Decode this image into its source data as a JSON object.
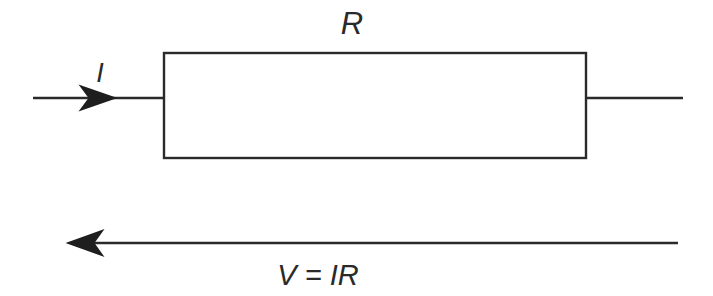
{
  "figure": {
    "kind": "circuit-diagram",
    "background_color": "#ffffff",
    "stroke_color": "#2a2a2a",
    "arrow_fill_color": "#1e1e1e",
    "width": 713,
    "height": 296
  },
  "labels": {
    "resistance": "R",
    "current": "I",
    "voltage_equation": "V = IR"
  },
  "components": {
    "resistor": {
      "name": "resistor-box",
      "label": "R",
      "x": 164,
      "y": 53,
      "width": 422,
      "height": 105
    },
    "input_wire": {
      "name": "input-wire",
      "label": "I",
      "from_x": 33,
      "to_x": 164,
      "y": 98,
      "direction": "right"
    },
    "output_wire": {
      "name": "output-wire",
      "from_x": 586,
      "to_x": 683,
      "y": 98,
      "direction": "right"
    },
    "voltage_arrow": {
      "name": "voltage-arrow",
      "label": "V = IR",
      "from_x": 678,
      "to_x": 66,
      "y": 243,
      "direction": "left"
    }
  },
  "annotations": {
    "resistance_label_pos": {
      "x": 352,
      "y": 34
    },
    "current_label_pos": {
      "x": 100,
      "y": 82
    },
    "voltage_label_pos": {
      "x": 318,
      "y": 285
    }
  }
}
